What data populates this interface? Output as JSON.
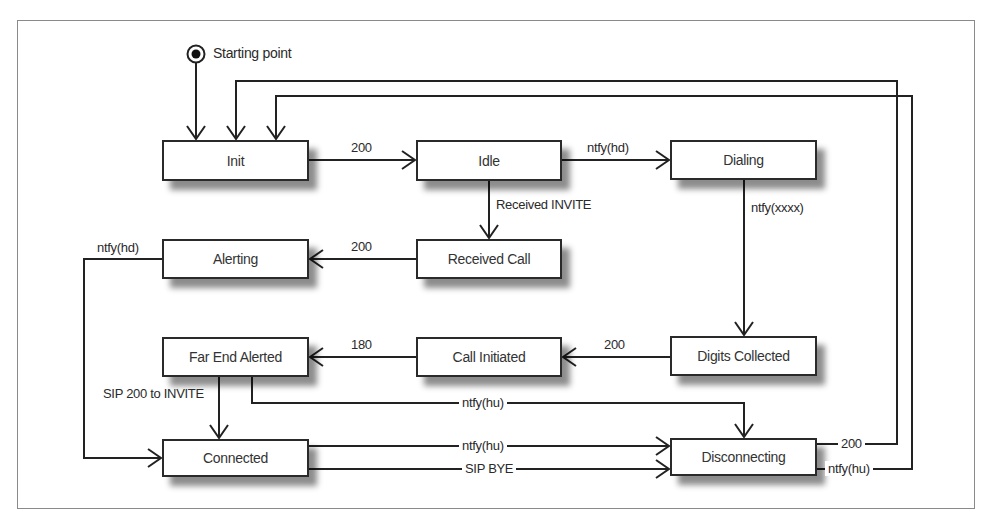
{
  "diagram": {
    "type": "state-machine",
    "start": {
      "label": "Starting point"
    },
    "states": [
      {
        "id": "init",
        "label": "Init"
      },
      {
        "id": "idle",
        "label": "Idle"
      },
      {
        "id": "dialing",
        "label": "Dialing"
      },
      {
        "id": "alerting",
        "label": "Alerting"
      },
      {
        "id": "received_call",
        "label": "Received Call"
      },
      {
        "id": "far_end_alerted",
        "label": "Far End Alerted"
      },
      {
        "id": "call_initiated",
        "label": "Call Initiated"
      },
      {
        "id": "digits_collected",
        "label": "Digits Collected"
      },
      {
        "id": "connected",
        "label": "Connected"
      },
      {
        "id": "disconnecting",
        "label": "Disconnecting"
      }
    ],
    "transitions": [
      {
        "from": "start",
        "to": "init",
        "label": ""
      },
      {
        "from": "init",
        "to": "idle",
        "label": "200"
      },
      {
        "from": "idle",
        "to": "dialing",
        "label": "ntfy(hd)"
      },
      {
        "from": "idle",
        "to": "received_call",
        "label": "Received INVITE"
      },
      {
        "from": "dialing",
        "to": "digits_collected",
        "label": "ntfy(xxxx)"
      },
      {
        "from": "received_call",
        "to": "alerting",
        "label": "200"
      },
      {
        "from": "alerting",
        "to": "connected",
        "label": "ntfy(hd)"
      },
      {
        "from": "digits_collected",
        "to": "call_initiated",
        "label": "200"
      },
      {
        "from": "call_initiated",
        "to": "far_end_alerted",
        "label": "180"
      },
      {
        "from": "far_end_alerted",
        "to": "connected",
        "label": "SIP 200 to INVITE"
      },
      {
        "from": "far_end_alerted",
        "to": "disconnecting",
        "label": "ntfy(hu)"
      },
      {
        "from": "connected",
        "to": "disconnecting",
        "label": "ntfy(hu)"
      },
      {
        "from": "connected",
        "to": "disconnecting",
        "label": "SIP BYE"
      },
      {
        "from": "disconnecting",
        "to": "init",
        "label": "200"
      },
      {
        "from": "disconnecting",
        "to": "init",
        "label": "ntfy(hu)"
      }
    ]
  }
}
